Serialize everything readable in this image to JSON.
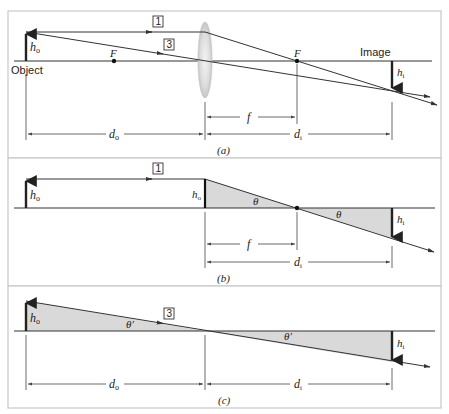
{
  "figure": {
    "panels": [
      {
        "id": "a",
        "caption": "(a)",
        "labels": {
          "object": "Object",
          "image": "Image",
          "h_o": "h",
          "h_o_sub": "o",
          "h_i": "h",
          "h_i_sub": "i",
          "focal_left": "F",
          "focal_right": "F",
          "ray1": "1",
          "ray3": "3",
          "f": "f",
          "d_o": "d",
          "d_o_sub": "o",
          "d_i": "d",
          "d_i_sub": "i"
        }
      },
      {
        "id": "b",
        "caption": "(b)",
        "labels": {
          "h_o": "h",
          "h_o_sub": "o",
          "h_o_lens": "h",
          "h_o_lens_sub": "o",
          "h_i": "h",
          "h_i_sub": "i",
          "theta1": "θ",
          "theta2": "θ",
          "ray1": "1",
          "f": "f",
          "d_i": "d",
          "d_i_sub": "i"
        }
      },
      {
        "id": "c",
        "caption": "(c)",
        "labels": {
          "h_o": "h",
          "h_o_sub": "o",
          "h_i": "h",
          "h_i_sub": "i",
          "theta1": "θ′",
          "theta2": "θ′",
          "ray3": "3",
          "d_o": "d",
          "d_o_sub": "o",
          "d_i": "d",
          "d_i_sub": "i"
        }
      }
    ],
    "colors": {
      "shade": "#d9d9d9",
      "lens": "#d0d0d0",
      "line": "#333333",
      "border": "#c8c8c8"
    }
  }
}
